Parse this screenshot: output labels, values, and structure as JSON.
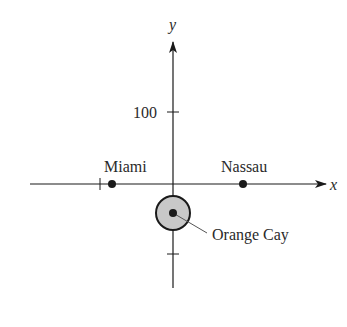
{
  "diagram": {
    "type": "coordinate-plane",
    "axes": {
      "x_label": "x",
      "y_label": "y",
      "y_tick_label": "100"
    },
    "points": [
      {
        "name": "Miami",
        "label": "Miami"
      },
      {
        "name": "Nassau",
        "label": "Nassau"
      },
      {
        "name": "Orange Cay",
        "label": "Orange Cay"
      }
    ],
    "colors": {
      "ink": "#1a1a1a",
      "circle_fill": "#c8c8c8",
      "leader": "#555555"
    }
  }
}
